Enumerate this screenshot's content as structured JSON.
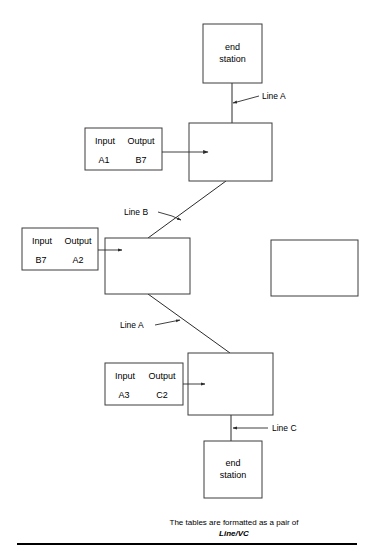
{
  "diagram": {
    "title": "",
    "nodes": [
      {
        "id": "end-station-top",
        "label_line1": "end",
        "label_line2": "station",
        "x": 203,
        "y": 24,
        "w": 59,
        "h": 59
      },
      {
        "id": "router-top",
        "label_line1": "",
        "label_line2": "",
        "x": 189,
        "y": 123,
        "w": 83,
        "h": 58
      },
      {
        "id": "router-middle",
        "label_line1": "",
        "label_line2": "",
        "x": 105,
        "y": 238,
        "w": 85,
        "h": 56
      },
      {
        "id": "router-right-empty",
        "label_line1": "",
        "label_line2": "",
        "x": 271,
        "y": 240,
        "w": 87,
        "h": 56
      },
      {
        "id": "router-bottom",
        "label_line1": "",
        "label_line2": "",
        "x": 188,
        "y": 353,
        "w": 85,
        "h": 62
      },
      {
        "id": "end-station-bottom",
        "label_line1": "end",
        "label_line2": "station",
        "x": 204,
        "y": 441,
        "w": 58,
        "h": 57
      }
    ],
    "tables": [
      {
        "id": "table-a1-b7",
        "x": 85,
        "y": 128,
        "w": 77,
        "h": 42,
        "header_input": "Input",
        "header_output": "Output",
        "value_input": "A1",
        "value_output": "B7"
      },
      {
        "id": "table-b7-a2",
        "x": 22,
        "y": 228,
        "w": 76,
        "h": 42,
        "header_input": "Input",
        "header_output": "Output",
        "value_input": "B7",
        "value_output": "A2"
      },
      {
        "id": "table-a3-c2",
        "x": 105,
        "y": 363,
        "w": 78,
        "h": 42,
        "header_input": "Input",
        "header_output": "Output",
        "value_input": "A3",
        "value_output": "C2"
      }
    ],
    "line_labels": [
      {
        "id": "line-a-top",
        "text": "Line A",
        "x": 262,
        "y": 99
      },
      {
        "id": "line-b",
        "text": "Line B",
        "x": 124,
        "y": 215
      },
      {
        "id": "line-a-lower",
        "text": "Line A",
        "x": 120,
        "y": 328
      },
      {
        "id": "line-c",
        "text": "Line C",
        "x": 272,
        "y": 431
      }
    ],
    "caption": {
      "line1": "The tables are formatted as a pair of",
      "line2": "Line/VC"
    }
  }
}
